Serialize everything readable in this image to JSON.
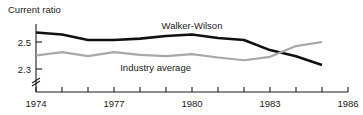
{
  "chart_data": {
    "type": "line",
    "title": "",
    "ylabel": "Current ratio",
    "xlabel": "",
    "x": [
      1974,
      1975,
      1976,
      1977,
      1978,
      1979,
      1980,
      1981,
      1982,
      1983,
      1984,
      1985
    ],
    "xlim": [
      1974,
      1986
    ],
    "ylim": [
      2.22,
      2.62
    ],
    "ytick_labels": [
      "2.5",
      "2.3"
    ],
    "ytick_values": [
      2.5,
      2.3
    ],
    "xtick_labels": [
      "1974",
      "1977",
      "1980",
      "1983",
      "1986"
    ],
    "xtick_values": [
      1974,
      1977,
      1980,
      1983,
      1986
    ],
    "minor_xticks": [
      1975,
      1976,
      1978,
      1979,
      1981,
      1982,
      1984,
      1985
    ],
    "axis_break": true,
    "grid": false,
    "legend_position": "inline-annotations",
    "series": [
      {
        "name": "Walker-Wilson",
        "color": "#111111",
        "width": 2.6,
        "label_x": 1980.0,
        "label_y": 2.6,
        "values": [
          2.57,
          2.555,
          2.515,
          2.515,
          2.525,
          2.545,
          2.555,
          2.53,
          2.515,
          2.44,
          2.395,
          2.33
        ]
      },
      {
        "name": "Industry average",
        "color": "#a8a8a8",
        "width": 2.2,
        "label_x": 1978.6,
        "label_y": 2.285,
        "values": [
          2.4,
          2.425,
          2.395,
          2.425,
          2.405,
          2.395,
          2.41,
          2.385,
          2.365,
          2.39,
          2.47,
          2.5
        ]
      }
    ]
  }
}
